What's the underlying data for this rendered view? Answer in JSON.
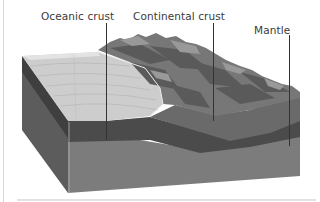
{
  "diagram": {
    "title": "",
    "labels": [
      {
        "id": "oceanic",
        "text": "Oceanic crust"
      },
      {
        "id": "continental",
        "text": "Continental crust"
      },
      {
        "id": "mantle",
        "text": "Mantle"
      }
    ],
    "colors": {
      "ocean_surface": "#c9c9c9",
      "ocean_surface_light": "#dcdcdc",
      "continent_dark": "#5e5e5e",
      "continent_mid": "#7a7a7a",
      "continent_light": "#9a9a9a",
      "crust_band": "#4a4a4a",
      "mantle_front": "#7d7d7d",
      "side_face": "#5a5a5a",
      "leader_line": "#333333",
      "label_text": "#3a3a3a"
    }
  }
}
